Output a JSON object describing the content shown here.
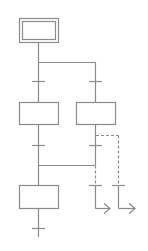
{
  "diagram": {
    "type": "sfc-grafcet",
    "colors": {
      "line": "#8a8a8a",
      "background": "#ffffff"
    },
    "steps": [
      {
        "id": "initial-step",
        "kind": "initial"
      },
      {
        "id": "step-left",
        "kind": "step"
      },
      {
        "id": "step-right",
        "kind": "step"
      },
      {
        "id": "step-join",
        "kind": "step"
      }
    ],
    "transitions": 7,
    "exit_arrows": 2
  }
}
